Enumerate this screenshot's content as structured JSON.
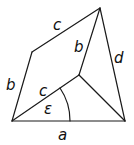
{
  "diagram": {
    "type": "geometric-quadrilateral",
    "stroke_color": "#1a1a1a",
    "vertices": {
      "bottom_left": [
        12,
        121
      ],
      "bottom_right": [
        125,
        121
      ],
      "top": [
        100,
        8
      ],
      "upper_left": [
        32,
        52
      ],
      "inner": [
        79,
        75
      ]
    },
    "labels": {
      "a": "a",
      "b_left": "b",
      "b_inner": "b",
      "c_top": "c",
      "c_inner": "c",
      "d": "d",
      "epsilon": "ε"
    }
  }
}
